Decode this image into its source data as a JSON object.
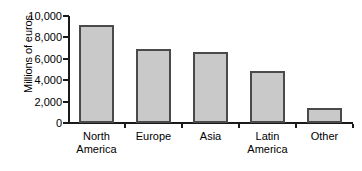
{
  "chart_data": {
    "type": "bar",
    "title": "",
    "subtitle": "",
    "xlabel": "",
    "ylabel": "Millions of euros",
    "categories": [
      "North America",
      "Europe",
      "Asia",
      "Latin America",
      "Other"
    ],
    "values": [
      9200,
      6900,
      6600,
      4900,
      1450
    ],
    "series": [
      {
        "name": "Millions of euros",
        "values": [
          9200,
          6900,
          6600,
          4900,
          1450
        ]
      }
    ],
    "ylim": [
      0,
      10000
    ],
    "ytick_values": [
      0,
      2000,
      4000,
      6000,
      8000,
      10000
    ],
    "ytick_labels": [
      "0",
      "2,000",
      "4,000",
      "6,000",
      "8,000",
      "10,000"
    ],
    "grid": false,
    "legend": false,
    "legend_position": "none",
    "bar_fill_color": "#c9c9c9",
    "bar_border_color": "#4a4a4a",
    "axis_color": "#1a1a1a",
    "background_color": "#ffffff",
    "annotations": []
  }
}
